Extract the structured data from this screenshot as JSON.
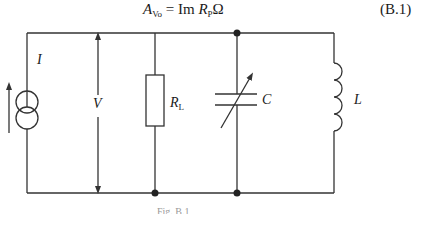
{
  "equation": {
    "lhs_symbol": "A",
    "lhs_subscript": "Vo",
    "equals": "=",
    "operator": "Im",
    "r_symbol": "R",
    "r_subscript": "P",
    "omega": "Ω",
    "number": "(B.1)"
  },
  "circuit": {
    "type": "parallel RLC with current source",
    "components": [
      {
        "id": "current-source",
        "label": "I",
        "kind": "current-source"
      },
      {
        "id": "voltage-indicator",
        "label": "V",
        "kind": "voltage-arrow"
      },
      {
        "id": "resistor",
        "label": "R",
        "subscript": "L",
        "kind": "resistor"
      },
      {
        "id": "capacitor",
        "label": "C",
        "kind": "variable-capacitor"
      },
      {
        "id": "inductor",
        "label": "L",
        "kind": "inductor"
      }
    ]
  },
  "labels": {
    "I": "I",
    "V": "V",
    "R": "R",
    "R_sub": "L",
    "C": "C",
    "L": "L"
  },
  "caption": "Fig. B.1",
  "colors": {
    "line": "#333333",
    "background": "#ffffff"
  }
}
